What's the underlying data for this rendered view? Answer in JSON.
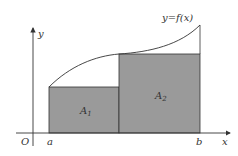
{
  "figure": {
    "function_label": "y=f(x)",
    "x_axis_label": "x",
    "y_axis_label": "y",
    "origin_label": "O",
    "left_bound_label": "a",
    "right_bound_label": "b",
    "region_1": {
      "label": "A",
      "subscript": "1"
    },
    "region_2": {
      "label": "A",
      "subscript": "2"
    }
  },
  "colors": {
    "fill": "#9a9a9a",
    "stroke": "#333333",
    "background": "#ffffff"
  }
}
